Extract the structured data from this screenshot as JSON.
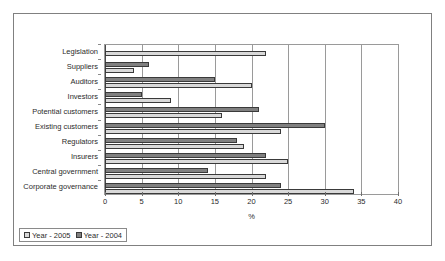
{
  "chart_data": {
    "type": "bar",
    "orientation": "horizontal",
    "title": "",
    "subtitle": "",
    "xlabel": "%",
    "ylabel": "",
    "xlim": [
      0,
      40
    ],
    "xticks": [
      0,
      5,
      10,
      15,
      20,
      25,
      30,
      35,
      40
    ],
    "grid": "vertical",
    "legend_position": "bottom-left",
    "categories": [
      "Legislation",
      "Suppliers",
      "Auditors",
      "Investors",
      "Potential customers",
      "Existing customers",
      "Regulators",
      "Insurers",
      "Central government",
      "Corporate governance"
    ],
    "series": [
      {
        "name": "Year - 2005",
        "color": "#d9d9d9",
        "values": [
          22,
          4,
          20,
          9,
          16,
          24,
          19,
          25,
          22,
          34
        ]
      },
      {
        "name": "Year - 2004",
        "color": "#808080",
        "values": [
          0,
          6,
          15,
          5,
          21,
          30,
          18,
          22,
          14,
          24
        ]
      }
    ]
  },
  "legend": {
    "entries": [
      {
        "label": "Year - 2005",
        "swatch": "y2005"
      },
      {
        "label": "Year - 2004",
        "swatch": "y2004"
      }
    ]
  },
  "axis": {
    "x_title": "%",
    "x_tick_labels": [
      "0",
      "5",
      "10",
      "15",
      "20",
      "25",
      "30",
      "35",
      "40"
    ]
  }
}
